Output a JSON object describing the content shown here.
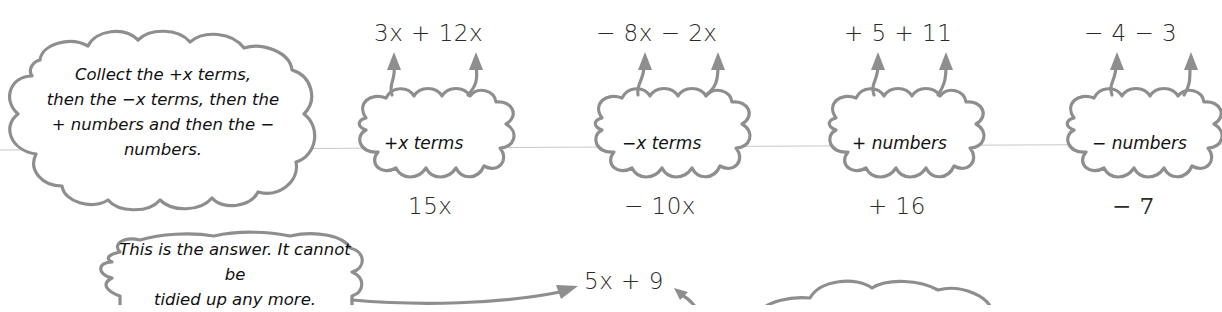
{
  "instruction_bubble": {
    "lines": [
      "Collect the +x terms,",
      "then the −x terms, then the",
      "+ numbers and then the −",
      "numbers."
    ]
  },
  "groups": [
    {
      "id": "plus-x",
      "terms": "3x + 12x",
      "label": "+x terms",
      "result": "15x"
    },
    {
      "id": "minus-x",
      "terms": "− 8x − 2x",
      "label": "−x terms",
      "result": "− 10x"
    },
    {
      "id": "plus-numbers",
      "terms": "+ 5 + 11",
      "label": "+ numbers",
      "result": "+ 16"
    },
    {
      "id": "minus-numbers",
      "terms": "− 4 − 3",
      "label": "− numbers",
      "result": "− 7"
    }
  ],
  "answer_bubble": {
    "lines": [
      "This is the answer. It cannot be",
      "tidied up any more."
    ]
  },
  "final_answer": "5x + 9",
  "partial_bubble": {
    "visible_text": ""
  },
  "colors": {
    "outline": "#8e8e8e",
    "text": "#111111",
    "background": "#ffffff"
  }
}
